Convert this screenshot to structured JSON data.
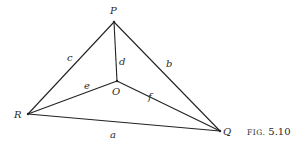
{
  "figure": {
    "caption_prefix": "FIG.",
    "caption_number": "5.10"
  },
  "vertices": {
    "P": {
      "label": "P",
      "x": 114,
      "y": 22
    },
    "O": {
      "label": "O",
      "x": 117,
      "y": 81
    },
    "R": {
      "label": "R",
      "x": 28,
      "y": 114
    },
    "Q": {
      "label": "Q",
      "x": 220,
      "y": 131
    }
  },
  "edges": [
    {
      "from": "Q",
      "to": "R",
      "label": "a"
    },
    {
      "from": "P",
      "to": "Q",
      "label": "b"
    },
    {
      "from": "P",
      "to": "R",
      "label": "c"
    },
    {
      "from": "P",
      "to": "O",
      "label": "d"
    },
    {
      "from": "R",
      "to": "O",
      "label": "e"
    },
    {
      "from": "O",
      "to": "Q",
      "label": "f"
    }
  ],
  "labels": {
    "a": "a",
    "b": "b",
    "c": "c",
    "d": "d",
    "e": "e",
    "f": "f",
    "P": "P",
    "O": "O",
    "R": "R",
    "Q": "Q"
  }
}
